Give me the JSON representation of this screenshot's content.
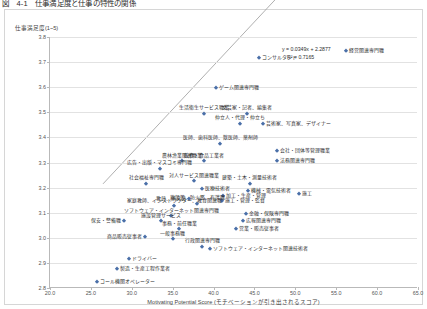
{
  "figure": {
    "caption": "図　4-1　仕事満足度と仕事の特性の関係"
  },
  "chart_data": {
    "type": "scatter",
    "title": "図　4-1　仕事満足度と仕事の特性の関係",
    "xlabel": "Motivating Potential Score (モチベーションが引き出されるスコア)",
    "ylabel": "仕事満足度(1~5)",
    "xlim": [
      20.0,
      65.0
    ],
    "ylim": [
      2.8,
      3.8
    ],
    "xticks": [
      "20.0",
      "25.0",
      "30.0",
      "35.0",
      "40.0",
      "45.0",
      "50.0",
      "55.0",
      "60.0",
      "65.0"
    ],
    "yticks": [
      "3.8",
      "3.7",
      "3.6",
      "3.5",
      "3.4",
      "3.3",
      "3.2",
      "3.1",
      "3.0",
      "2.9",
      "2.8"
    ],
    "grid": true,
    "legend": "none",
    "marker_color": "#4a6fa8",
    "trendline": {
      "equation": "y = 0.0349x + 2.2877",
      "r2": "R² = 0.7165",
      "slope": 0.0349,
      "intercept": 2.2877,
      "x_start": 26.5,
      "x_end": 56.5
    },
    "points": [
      {
        "label": "経営関連専門職",
        "x": 56.2,
        "y": 3.745,
        "pos": "r"
      },
      {
        "label": "コンサルタント",
        "x": 45.6,
        "y": 3.715,
        "pos": "r"
      },
      {
        "label": "ゲーム関連専門職",
        "x": 40.3,
        "y": 3.595,
        "pos": "r"
      },
      {
        "label": "生活衛生サービス職業",
        "x": 38.8,
        "y": 3.495,
        "pos": "c"
      },
      {
        "label": "文芸家・記者、編集者",
        "x": 44.1,
        "y": 3.495,
        "pos": "c"
      },
      {
        "label": "芸術家、写真家、デザイナー",
        "x": 46.0,
        "y": 3.455,
        "pos": "r"
      },
      {
        "label": "仲立人・代理・仲立ち",
        "x": 43.2,
        "y": 3.455,
        "pos": "c"
      },
      {
        "label": "医師、歯科医師、獣医師、薬剤師",
        "x": 40.8,
        "y": 3.375,
        "pos": "c"
      },
      {
        "label": "会社・団体等管理職業",
        "x": 47.8,
        "y": 3.345,
        "pos": "r"
      },
      {
        "label": "法務関連専門職",
        "x": 47.8,
        "y": 3.305,
        "pos": "r"
      },
      {
        "label": "農林漁業関連職業",
        "x": 36.2,
        "y": 3.305,
        "pos": "c"
      },
      {
        "label": "飲食・食品工業者",
        "x": 38.8,
        "y": 3.305,
        "pos": "c"
      },
      {
        "label": "広告・出版・マスコミ専門職",
        "x": 33.4,
        "y": 3.275,
        "pos": "c"
      },
      {
        "label": "社会福祉専門職",
        "x": 31.8,
        "y": 3.215,
        "pos": "c"
      },
      {
        "label": "対人サービス関連職業",
        "x": 37.6,
        "y": 3.225,
        "pos": "c"
      },
      {
        "label": "建築・土木・測量技術者",
        "x": 44.4,
        "y": 3.215,
        "pos": "c"
      },
      {
        "label": "医療技術者",
        "x": 38.6,
        "y": 3.195,
        "pos": "r"
      },
      {
        "label": "機械・電気技術者",
        "x": 44.2,
        "y": 3.185,
        "pos": "r"
      },
      {
        "label": "加工・生産・管理",
        "x": 41.2,
        "y": 3.165,
        "pos": "r"
      },
      {
        "label": "施工・管理・監督",
        "x": 41.0,
        "y": 3.145,
        "pos": "r"
      },
      {
        "label": "施設等、防火鑑、有護職",
        "x": 38.0,
        "y": 3.135,
        "pos": "c"
      },
      {
        "label": "施工",
        "x": 50.5,
        "y": 3.175,
        "pos": "r"
      },
      {
        "label": "教員、研究員",
        "x": 37.0,
        "y": 3.155,
        "pos": "l"
      },
      {
        "label": "家庭教師、インストラクター、教育関連職",
        "x": 35.2,
        "y": 3.125,
        "pos": "c"
      },
      {
        "label": "金融・保険専門職",
        "x": 44.0,
        "y": 3.095,
        "pos": "r"
      },
      {
        "label": "ソフトウェア・インターネット関連専門職",
        "x": 34.8,
        "y": 3.085,
        "pos": "c"
      },
      {
        "label": "保安・警備職",
        "x": 29.0,
        "y": 3.065,
        "pos": "l"
      },
      {
        "label": "施設管理サービス",
        "x": 33.6,
        "y": 3.065,
        "pos": "c"
      },
      {
        "label": "広報関連専門職",
        "x": 43.6,
        "y": 3.065,
        "pos": "r"
      },
      {
        "label": "事務・前任職業",
        "x": 35.8,
        "y": 3.035,
        "pos": "c"
      },
      {
        "label": "営業・販売従事者",
        "x": 42.8,
        "y": 3.035,
        "pos": "r"
      },
      {
        "label": "商品販売従事者",
        "x": 31.6,
        "y": 3.005,
        "pos": "l"
      },
      {
        "label": "一般事務職",
        "x": 35.0,
        "y": 2.995,
        "pos": "c"
      },
      {
        "label": "行政関連専門職",
        "x": 38.6,
        "y": 2.965,
        "pos": "c"
      },
      {
        "label": "ソフトウェア・インターネット関連技術者",
        "x": 39.6,
        "y": 2.955,
        "pos": "r"
      },
      {
        "label": "ドライバー",
        "x": 29.6,
        "y": 2.915,
        "pos": "r"
      },
      {
        "label": "製造・生産工程作業者",
        "x": 28.2,
        "y": 2.875,
        "pos": "r"
      },
      {
        "label": "コール機関オペレーター",
        "x": 25.8,
        "y": 2.825,
        "pos": "r"
      }
    ]
  }
}
